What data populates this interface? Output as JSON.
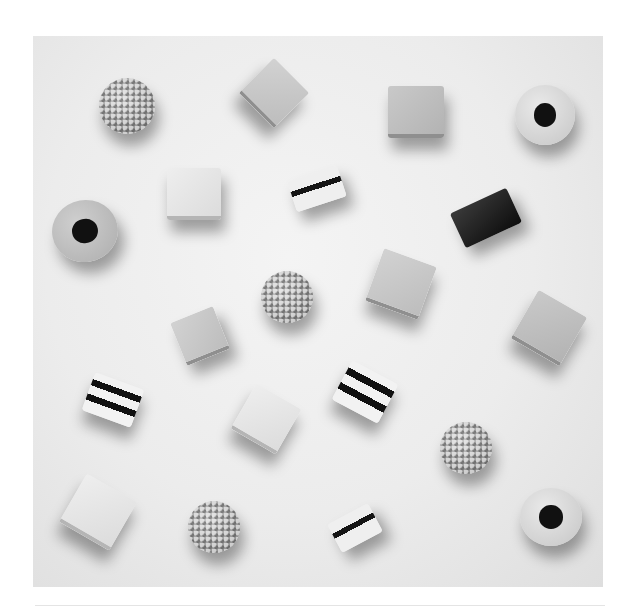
{
  "image": {
    "description": "Black-and-white photograph of assorted liquorice allsorts candies scattered on a light surface",
    "background_color": "#ececec",
    "candy_count": 20
  },
  "candies": [
    {
      "type": "nonpareil-ball",
      "label": "Nonpareil ball"
    },
    {
      "type": "square",
      "label": "Square"
    },
    {
      "type": "square",
      "label": "Square"
    },
    {
      "type": "ring",
      "label": "Ring with liquorice center"
    },
    {
      "type": "ring",
      "label": "Ring with liquorice center"
    },
    {
      "type": "square",
      "label": "Square"
    },
    {
      "type": "striped",
      "label": "Striped sandwich"
    },
    {
      "type": "liquorice-block",
      "label": "Liquorice block"
    },
    {
      "type": "nonpareil-ball",
      "label": "Nonpareil ball"
    },
    {
      "type": "square",
      "label": "Square"
    },
    {
      "type": "square",
      "label": "Square"
    },
    {
      "type": "square",
      "label": "Square"
    },
    {
      "type": "striped",
      "label": "Striped sandwich"
    },
    {
      "type": "square",
      "label": "Square"
    },
    {
      "type": "striped",
      "label": "Striped sandwich"
    },
    {
      "type": "nonpareil-ball",
      "label": "Nonpareil ball"
    },
    {
      "type": "square",
      "label": "Square"
    },
    {
      "type": "nonpareil-ball",
      "label": "Nonpareil ball"
    },
    {
      "type": "striped",
      "label": "Striped sandwich"
    },
    {
      "type": "ring",
      "label": "Ring with liquorice center"
    }
  ]
}
